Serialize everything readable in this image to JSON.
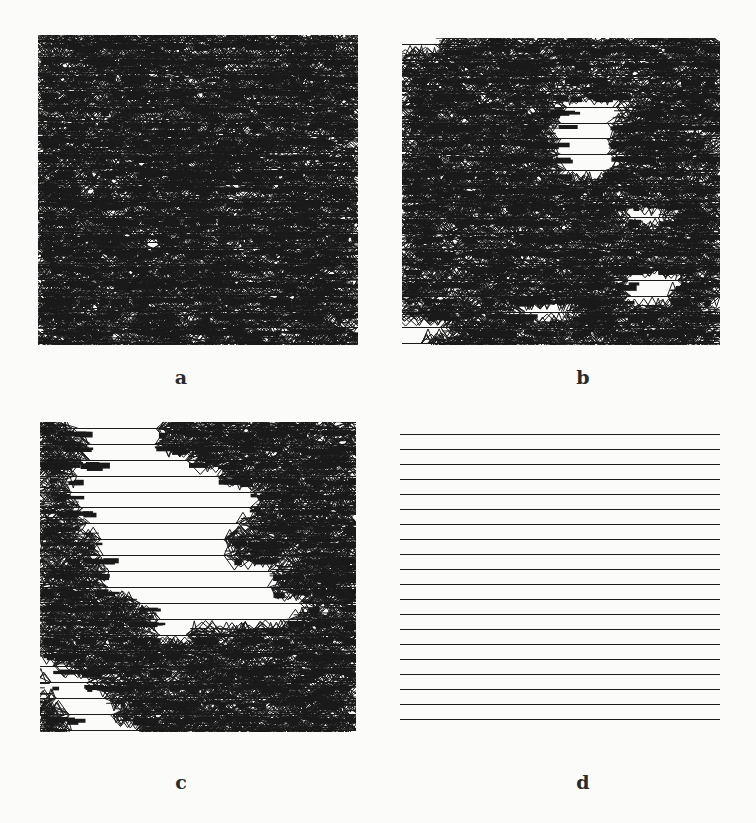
{
  "figure": {
    "background": "#fbfbfa",
    "ink": "#1a1a1a",
    "panels": [
      {
        "id": "a",
        "label": "a",
        "x": 38,
        "y": 35,
        "w": 320,
        "h": 310,
        "rows": 20,
        "mode": "dense",
        "density": 1.0,
        "gaps": []
      },
      {
        "id": "b",
        "label": "b",
        "x": 402,
        "y": 38,
        "w": 318,
        "h": 307,
        "rows": 20,
        "mode": "dense",
        "density": 0.92,
        "gaps": [
          [
            0,
            0.0,
            0.1
          ],
          [
            4,
            0.52,
            0.66
          ],
          [
            5,
            0.5,
            0.64
          ],
          [
            6,
            0.5,
            0.64
          ],
          [
            7,
            0.5,
            0.64
          ],
          [
            8,
            0.52,
            0.62
          ],
          [
            11,
            0.72,
            0.8
          ],
          [
            15,
            0.72,
            0.86
          ],
          [
            16,
            0.72,
            0.82
          ],
          [
            17,
            0.4,
            0.5
          ],
          [
            18,
            0.0,
            0.12
          ],
          [
            19,
            0.0,
            0.06
          ]
        ]
      },
      {
        "id": "c",
        "label": "c",
        "x": 40,
        "y": 422,
        "w": 316,
        "h": 310,
        "rows": 20,
        "mode": "dense",
        "density": 0.95,
        "gaps": [
          [
            0,
            0.12,
            0.36
          ],
          [
            1,
            0.16,
            0.36
          ],
          [
            2,
            0.16,
            0.46
          ],
          [
            3,
            0.12,
            0.56
          ],
          [
            4,
            0.1,
            0.66
          ],
          [
            5,
            0.14,
            0.66
          ],
          [
            6,
            0.16,
            0.62
          ],
          [
            7,
            0.2,
            0.58
          ],
          [
            8,
            0.2,
            0.58
          ],
          [
            9,
            0.22,
            0.72
          ],
          [
            10,
            0.22,
            0.72
          ],
          [
            11,
            0.32,
            0.82
          ],
          [
            12,
            0.38,
            0.78
          ],
          [
            13,
            0.38,
            0.46
          ],
          [
            15,
            0.0,
            0.04
          ],
          [
            16,
            0.04,
            0.14
          ],
          [
            17,
            0.06,
            0.2
          ],
          [
            18,
            0.1,
            0.22
          ],
          [
            19,
            0.1,
            0.3
          ]
        ]
      },
      {
        "id": "d",
        "label": "d",
        "x": 400,
        "y": 428,
        "w": 320,
        "h": 293,
        "rows": 20,
        "mode": "lines",
        "density": 0,
        "gaps": []
      }
    ],
    "labels": [
      {
        "text": "a",
        "x": 181,
        "y": 366
      },
      {
        "text": "b",
        "x": 583,
        "y": 366
      },
      {
        "text": "c",
        "x": 181,
        "y": 771
      },
      {
        "text": "d",
        "x": 583,
        "y": 771
      }
    ]
  }
}
